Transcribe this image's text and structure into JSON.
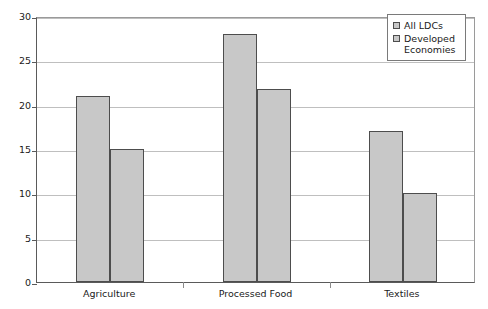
{
  "chart_data": {
    "type": "bar",
    "title": "",
    "subtitle": "",
    "xlabel": "",
    "ylabel": "",
    "categories": [
      "Agriculture",
      "Processed Food",
      "Textiles"
    ],
    "series": [
      {
        "name": "All LDCs",
        "values": [
          21,
          28,
          17
        ],
        "color": "#c8c8c8"
      },
      {
        "name": "Developed Economies",
        "values": [
          15,
          21.8,
          10
        ],
        "color": "#c8c8c8"
      }
    ],
    "ylim": [
      0,
      30
    ],
    "yticks": [
      0,
      5,
      10,
      15,
      20,
      25,
      30
    ],
    "ytick_labels": [
      "0",
      "5",
      "10",
      "15",
      "20",
      "25",
      "30"
    ],
    "grid": true,
    "grid_axis": "y",
    "legend_position": "top-right",
    "bar_edge_color": "#4d4d4d",
    "grid_color": "#bfbfbf",
    "axis_color": "#5a5a5a",
    "background": "#ffffff"
  },
  "legend": {
    "entries": [
      {
        "label": "All LDCs"
      },
      {
        "label": "Developed Economies"
      }
    ]
  }
}
